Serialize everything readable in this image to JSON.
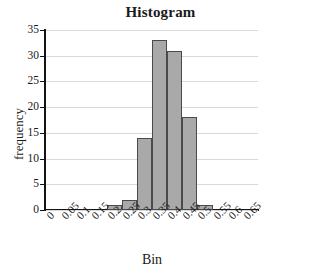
{
  "chart_data": {
    "type": "bar",
    "title": "Histogram",
    "xlabel": "Bin",
    "ylabel": "frequency",
    "categories": [
      "0",
      "0.05",
      "0.1",
      "0.15",
      "0.2",
      "0.25",
      "0.3",
      "0.35",
      "0.4",
      "0.45",
      "0.5",
      "0.55",
      "0.6",
      "0.65"
    ],
    "values": [
      0,
      0,
      0,
      0,
      1,
      2,
      14,
      33,
      31,
      18,
      1,
      0,
      0,
      0
    ],
    "xtick_labels": [
      "0",
      "0.05",
      "0.1",
      "0.15",
      "0.2",
      "0.25",
      "0.3",
      "0.35",
      "0.4",
      "0.45",
      "0.5",
      "0.55",
      "0.6",
      "0.65"
    ],
    "ytick_labels": [
      "0",
      "5",
      "10",
      "15",
      "20",
      "25",
      "30",
      "35"
    ],
    "ytick_values": [
      0,
      5,
      10,
      15,
      20,
      25,
      30,
      35
    ],
    "ylim": [
      0,
      35
    ],
    "grid": "horizontal",
    "legend": "none",
    "bar_fill_color": "#a9a9a9",
    "bar_border_color": "#4a4a4a",
    "gridline_color": "#d9d9d9",
    "axis_color": "#141414"
  }
}
